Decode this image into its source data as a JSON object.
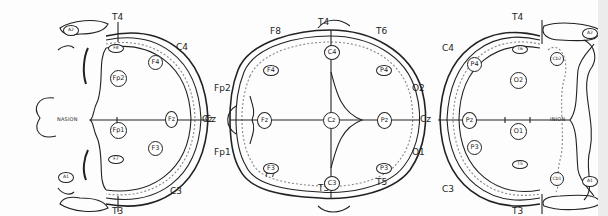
{
  "figure": {
    "panel_label": "A",
    "views": [
      {
        "name": "frontal-view",
        "landmark": "NASION",
        "outer_labels": [
          "T4",
          "C4",
          "Cz",
          "C3",
          "T3"
        ],
        "electrodes": [
          "A2",
          "F8",
          "F4",
          "Fp2",
          "Fz",
          "Fp1",
          "F3",
          "F7",
          "A1"
        ]
      },
      {
        "name": "top-view",
        "outer_labels": [
          "T4",
          "F8",
          "T6",
          "Fp2",
          "Cz",
          "O2",
          "Fp1",
          "O1",
          "F7",
          "T5",
          "T3"
        ],
        "electrodes": [
          "C4",
          "F4",
          "P4",
          "Fz",
          "Cz",
          "Pz",
          "F3",
          "P3",
          "C3"
        ]
      },
      {
        "name": "occipital-view",
        "landmark": "INION",
        "outer_labels": [
          "T4",
          "C4",
          "Cz",
          "C3",
          "T3"
        ],
        "electrodes": [
          "A2",
          "T6",
          "Cb2",
          "P4",
          "O2",
          "Pz",
          "O1",
          "P3",
          "Cb1",
          "T5",
          "A1"
        ]
      }
    ]
  },
  "labels": {
    "v1": {
      "t4": "T4",
      "c4": "C4",
      "cz": "Cz",
      "c3": "C3",
      "t3": "T3",
      "nasion": "NASION",
      "panel": "A"
    },
    "v1e": {
      "a2": "A2",
      "f8": "F8",
      "f4": "F4",
      "fp2": "Fp2",
      "fz": "Fz",
      "fp1": "Fp1",
      "f3": "F3",
      "f7": "F7",
      "a1": "A1"
    },
    "v2": {
      "t4": "T4",
      "f8": "F8",
      "t6": "T6",
      "fp2": "Fp2",
      "cz": "Cz",
      "o2": "O2",
      "fp1": "Fp1",
      "o1": "O1",
      "f7": "F7",
      "t5": "T5",
      "t3": "T3"
    },
    "v2e": {
      "c4": "C4",
      "f4": "F4",
      "p4": "P4",
      "fz": "Fz",
      "cz": "Cz",
      "pz": "Pz",
      "f3": "F3",
      "p3": "P3",
      "c3": "C3"
    },
    "v3": {
      "t4": "T4",
      "c4": "C4",
      "cz": "Cz",
      "c3": "C3",
      "t3": "T3",
      "inion": "INION"
    },
    "v3e": {
      "a2": "A2",
      "t6": "T6",
      "cb2": "Cb2",
      "p4": "P4",
      "o2": "O2",
      "pz": "Pz",
      "o1": "O1",
      "p3": "P3",
      "cb1": "Cb1",
      "t5": "T5",
      "a1": "A1"
    }
  },
  "colors": {
    "ink": "#222222",
    "paper": "#fdfdfd",
    "dotted": "#888888"
  }
}
